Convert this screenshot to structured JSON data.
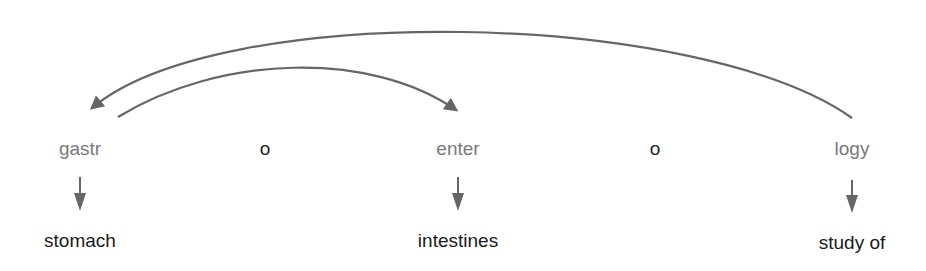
{
  "diagram": {
    "word": "gastroenterology",
    "colors": {
      "root_text": "#7a7a7a",
      "combining_vowel_text": "#222222",
      "meaning_text": "#1a1a1a",
      "arrow": "#666666"
    },
    "parts": [
      {
        "text": "gastr",
        "type": "root",
        "x": 80
      },
      {
        "text": "o",
        "type": "combining-vowel",
        "x": 265
      },
      {
        "text": "enter",
        "type": "root",
        "x": 458
      },
      {
        "text": "o",
        "type": "combining-vowel",
        "x": 655
      },
      {
        "text": "logy",
        "type": "suffix",
        "x": 852
      }
    ],
    "meanings": [
      {
        "text": "stomach",
        "x": 80
      },
      {
        "text": "intestines",
        "x": 458
      },
      {
        "text": "study of",
        "x": 852
      }
    ],
    "reading_arrows": [
      {
        "from": "logy",
        "to": "gastr",
        "description": "outer arc: start with suffix, then read first root"
      },
      {
        "from": "gastr",
        "to": "enter",
        "description": "inner arc: then read next root"
      }
    ]
  }
}
